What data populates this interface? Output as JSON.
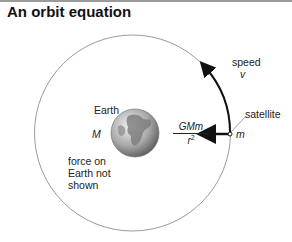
{
  "title": "An orbit equation",
  "labels": {
    "speed": "speed",
    "speed_symbol": "v",
    "satellite": "satellite",
    "satellite_mass": "m",
    "earth": "Earth",
    "earth_mass": "M",
    "force_note_line1": "force on",
    "force_note_line2": "Earth not",
    "force_note_line3": "shown",
    "force_numerator": "GMm",
    "force_denominator": "r",
    "force_denominator_exp": "2"
  },
  "colors": {
    "orbit": "#9a9a9a",
    "arrow": "#111111",
    "earth_light": "#e6e6e6",
    "earth_dark": "#6e6e6e"
  }
}
